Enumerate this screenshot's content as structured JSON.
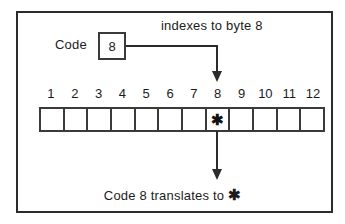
{
  "diagram": {
    "type": "diagram",
    "border_color": "#2b2b2b",
    "line_color": "#2b2b2b",
    "background": "#ffffff",
    "code_label": "Code",
    "code_value": "8",
    "index_caption": "indexes to byte 8",
    "result_caption_prefix": "Code 8 translates to",
    "result_glyph": "✱",
    "cell_count": 12,
    "numbers": [
      "1",
      "2",
      "3",
      "4",
      "5",
      "6",
      "7",
      "8",
      "9",
      "10",
      "11",
      "12"
    ],
    "cells": [
      {
        "index": "1",
        "content": ""
      },
      {
        "index": "2",
        "content": ""
      },
      {
        "index": "3",
        "content": ""
      },
      {
        "index": "4",
        "content": ""
      },
      {
        "index": "5",
        "content": ""
      },
      {
        "index": "6",
        "content": ""
      },
      {
        "index": "7",
        "content": ""
      },
      {
        "index": "8",
        "content": "✱"
      },
      {
        "index": "9",
        "content": ""
      },
      {
        "index": "10",
        "content": ""
      },
      {
        "index": "11",
        "content": ""
      },
      {
        "index": "12",
        "content": ""
      }
    ],
    "highlighted_cell": "8",
    "arrows": [
      {
        "name": "index-arrow",
        "from": "code-box",
        "to": "byte-8",
        "direction": "down"
      },
      {
        "name": "result-arrow",
        "from": "byte-8",
        "to": "result-caption",
        "direction": "down"
      }
    ]
  }
}
